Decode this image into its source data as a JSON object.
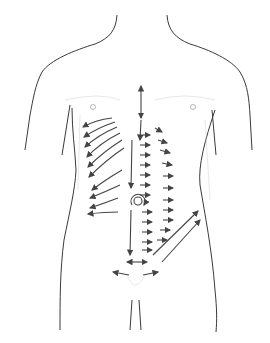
{
  "figure": {
    "title": "Abdominal massage stroke directions on anterior torso",
    "colors": {
      "outline": "#3a3a3a",
      "shade": "#c8c8c8",
      "arrow": "#444444",
      "background": "#ffffff"
    },
    "regions": [
      "neck",
      "shoulders",
      "chest",
      "rib-cage",
      "abdomen",
      "umbilicus",
      "pelvis",
      "thighs"
    ],
    "arrow_groups": [
      {
        "name": "sternum-vertical",
        "direction": "bidirectional-vertical"
      },
      {
        "name": "left-ribcage-fan",
        "direction": "outward-left"
      },
      {
        "name": "center-vertical-down",
        "direction": "down"
      },
      {
        "name": "right-abdomen-columns",
        "direction": "right"
      },
      {
        "name": "umbilicus-circle",
        "direction": "circular"
      },
      {
        "name": "right-iliac-diagonal",
        "direction": "up-right"
      },
      {
        "name": "pubic-horizontal",
        "direction": "bidirectional-horizontal"
      }
    ]
  }
}
